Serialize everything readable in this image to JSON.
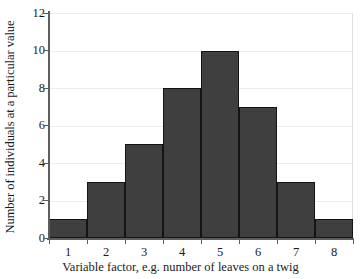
{
  "chart_data": {
    "type": "bar",
    "title": "",
    "subtitle": "",
    "xlabel": "Variable factor, e.g. number of leaves on a twig",
    "ylabel": "Number of individuals at a particular value",
    "categories": [
      "1",
      "2",
      "3",
      "4",
      "5",
      "6",
      "7",
      "8"
    ],
    "values": [
      1,
      3,
      5,
      8,
      10,
      7,
      3,
      1
    ],
    "xlim": [
      0.5,
      8.5
    ],
    "ylim": [
      0,
      12
    ],
    "ytick_labels": [
      "0",
      "2",
      "4",
      "6",
      "8",
      "10",
      "12"
    ],
    "ytick_values": [
      0,
      2,
      4,
      6,
      8,
      10,
      12
    ],
    "xtick_labels": [
      "1",
      "2",
      "3",
      "4",
      "5",
      "6",
      "7",
      "8"
    ],
    "grid": "horizontal",
    "legend": "none",
    "bar_fill_color": "#3f3f3f",
    "bar_edge_color": "#141414",
    "gridline_color": "#ececec",
    "axis_color": "#5e5e5e",
    "background_color": "#ffffff"
  }
}
